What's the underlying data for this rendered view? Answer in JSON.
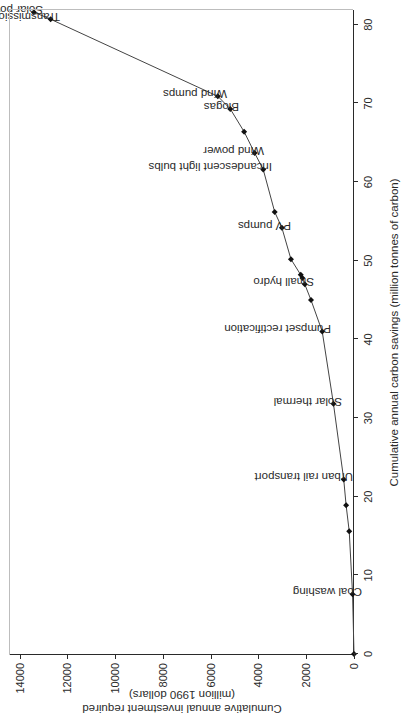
{
  "chart_data": {
    "type": "line",
    "title": "",
    "xlabel": "Cumulative annual carbon savings (million tonnes of carbon)",
    "ylabel_line1": "Cumulative annual investment required",
    "ylabel_line2": "(million 1990 dollars)",
    "xlim": [
      0,
      82
    ],
    "ylim": [
      0,
      14400
    ],
    "xticks": [
      0,
      10,
      20,
      30,
      40,
      50,
      60,
      70,
      80
    ],
    "yticks": [
      0,
      2000,
      4000,
      6000,
      8000,
      10000,
      12000,
      14000
    ],
    "grid": false,
    "legend": "none",
    "marker": "filled-diamond",
    "line_color": "#444444",
    "points": [
      {
        "label": "",
        "x": 0.0,
        "y": 0
      },
      {
        "label": "Coal washing",
        "x": 7.6,
        "y": 60
      },
      {
        "label": "",
        "x": 15.6,
        "y": 200
      },
      {
        "label": "",
        "x": 18.9,
        "y": 330
      },
      {
        "label": "Urban rail transport",
        "x": 22.2,
        "y": 430
      },
      {
        "label": "Solar thermal",
        "x": 31.8,
        "y": 860
      },
      {
        "label": "Pumpset rectification",
        "x": 41.0,
        "y": 1330
      },
      {
        "label": "",
        "x": 45.0,
        "y": 1800
      },
      {
        "label": "Small hydro",
        "x": 47.0,
        "y": 2060
      },
      {
        "label": "",
        "x": 47.8,
        "y": 2160
      },
      {
        "label": "",
        "x": 48.2,
        "y": 2230
      },
      {
        "label": "",
        "x": 50.2,
        "y": 2640
      },
      {
        "label": "PV pumps",
        "x": 54.2,
        "y": 3020
      },
      {
        "label": "",
        "x": 56.2,
        "y": 3320
      },
      {
        "label": "Incandescent light bulbs",
        "x": 61.6,
        "y": 3800
      },
      {
        "label": "Wind power",
        "x": 63.7,
        "y": 4160
      },
      {
        "label": "",
        "x": 66.4,
        "y": 4600
      },
      {
        "label": "Biogas",
        "x": 69.3,
        "y": 5180
      },
      {
        "label": "Wind pumps",
        "x": 70.9,
        "y": 5700
      },
      {
        "label": "Transmission and distribution systems",
        "x": 80.7,
        "y": 12700
      },
      {
        "label": "Solar power",
        "x": 81.6,
        "y": 13400
      }
    ]
  },
  "axis": {
    "x_title": "Cumulative annual carbon savings (million tonnes of carbon)",
    "y_title_line1": "Cumulative annual investment required",
    "y_title_line2": "(million 1990 dollars)",
    "x_tick_labels": [
      "0",
      "10",
      "20",
      "30",
      "40",
      "50",
      "60",
      "70",
      "80"
    ],
    "y_tick_labels": [
      "0",
      "2000",
      "4000",
      "6000",
      "8000",
      "10000",
      "12000",
      "14000"
    ]
  },
  "annotations": [
    {
      "name": "coal-washing",
      "text": "Coal washing"
    },
    {
      "name": "urban-rail-transport",
      "text": "Urban rail transport"
    },
    {
      "name": "solar-thermal",
      "text": "Solar thermal"
    },
    {
      "name": "pumpset-rectification",
      "text": "Pumpset rectification"
    },
    {
      "name": "small-hydro",
      "text": "Small hydro"
    },
    {
      "name": "pv-pumps",
      "text": "PV pumps"
    },
    {
      "name": "incandescent-light-bulbs",
      "text": "Incandescent light bulbs"
    },
    {
      "name": "wind-power",
      "text": "Wind power"
    },
    {
      "name": "biogas",
      "text": "Biogas"
    },
    {
      "name": "wind-pumps",
      "text": "Wind pumps"
    },
    {
      "name": "transmission-and-distribution-systems",
      "text": "Transmission and distribution systems"
    },
    {
      "name": "solar-power",
      "text": "Solar power"
    }
  ],
  "colors": {
    "line": "#444444",
    "marker": "#111111",
    "axis": "#2a2a2a",
    "text": "#2a2a2a",
    "background": "#ffffff"
  }
}
